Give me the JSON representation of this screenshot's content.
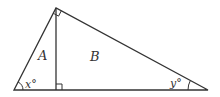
{
  "diagram": {
    "type": "right-triangle-with-altitude",
    "stroke_color": "#333333",
    "background": "#ffffff",
    "vertices": {
      "left": [
        14,
        90
      ],
      "top": [
        56,
        8
      ],
      "right": [
        208,
        90
      ],
      "foot": [
        56,
        90
      ]
    },
    "labels": {
      "region_a": "A",
      "region_b": "B",
      "angle_left": "x°",
      "angle_right": "y°"
    },
    "right_angles": [
      "top-vertex",
      "altitude-foot"
    ]
  }
}
